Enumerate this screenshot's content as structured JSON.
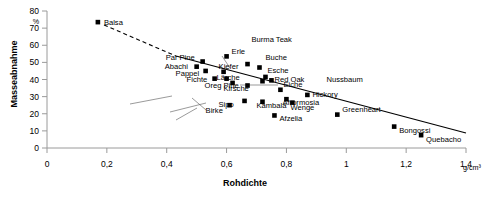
{
  "chart_data": {
    "type": "scatter",
    "title": "",
    "xlabel": "Rohdichte",
    "ylabel": "Masseabnahme",
    "x_unit": "g/cm³",
    "y_unit": "%",
    "xlim": [
      0,
      1.4
    ],
    "ylim": [
      0,
      80
    ],
    "xticks": [
      0,
      0.2,
      0.4,
      0.6,
      0.8,
      1.0,
      1.2,
      1.4
    ],
    "xtick_labels": [
      "0",
      "0,2",
      "0,4",
      "0,6",
      "0,8",
      "1",
      "1,2",
      "1,4"
    ],
    "yticks": [
      0,
      10,
      20,
      30,
      40,
      50,
      60,
      70,
      80
    ],
    "ytick_labels": [
      "0",
      "10",
      "20",
      "30",
      "40",
      "50",
      "60",
      "70",
      "80"
    ],
    "grid": false,
    "legend": "none",
    "marker": "filled-square",
    "trendline": {
      "present": true,
      "style": "solid-with-dashed-extension",
      "note": "Dashed from Balsa point down to approx x=0.42, then solid to x=1.33"
    },
    "points": [
      {
        "name": "Balsa",
        "x": 0.17,
        "y": 73.5,
        "label_dx": 6,
        "label_dy": 3
      },
      {
        "name": "Par Pine",
        "x": 0.52,
        "y": 50.5,
        "label_dx": -37,
        "label_dy": -2
      },
      {
        "name": "Erle",
        "x": 0.6,
        "y": 53.5,
        "label_dx": 5,
        "label_dy": -2
      },
      {
        "name": "Abachi",
        "x": 0.5,
        "y": 47.5,
        "label_dx": -32,
        "label_dy": 2
      },
      {
        "name": "Pappel",
        "x": 0.53,
        "y": 45.0,
        "label_dx": -30,
        "label_dy": 5
      },
      {
        "name": "Kiefer",
        "x": 0.59,
        "y": 44.5,
        "label_dx": -5,
        "label_dy": -3
      },
      {
        "name": "Burma Teak",
        "x": 0.67,
        "y": 49.0,
        "label_dx": 4,
        "label_dy": -22
      },
      {
        "name": "Buche",
        "x": 0.71,
        "y": 47.0,
        "label_dx": 6,
        "label_dy": -8
      },
      {
        "name": "Fichte",
        "x": 0.56,
        "y": 40.5,
        "label_dx": -28,
        "label_dy": 3
      },
      {
        "name": "Lärche",
        "x": 0.6,
        "y": 40.5,
        "label_dx": -10,
        "label_dy": 1
      },
      {
        "name": "Oreg Pine",
        "x": 0.62,
        "y": 38.0,
        "label_dx": -28,
        "label_dy": 5
      },
      {
        "name": "Esche",
        "x": 0.73,
        "y": 41.5,
        "label_dx": 2,
        "label_dy": -4
      },
      {
        "name": "Red Oak",
        "x": 0.75,
        "y": 39.5,
        "label_dx": 3,
        "label_dy": 2
      },
      {
        "name": "Nussbaum",
        "x": 0.72,
        "y": 39.0,
        "label_dx": 64,
        "label_dy": 1
      },
      {
        "name": "Kirsche",
        "x": 0.67,
        "y": 36.5,
        "label_dx": -24,
        "label_dy": 6
      },
      {
        "name": "Eiche",
        "x": 0.78,
        "y": 34.0,
        "label_dx": 3,
        "label_dy": -3
      },
      {
        "name": "Hickory",
        "x": 0.87,
        "y": 31.0,
        "label_dx": 5,
        "label_dy": 2
      },
      {
        "name": "Afrormosia",
        "x": 0.8,
        "y": 28.5,
        "label_dx": -4,
        "label_dy": 6
      },
      {
        "name": "Kambala",
        "x": 0.72,
        "y": 27.0,
        "label_dx": -6,
        "label_dy": 6
      },
      {
        "name": "Wenge",
        "x": 0.82,
        "y": 26.5,
        "label_dx": -2,
        "label_dy": 7
      },
      {
        "name": "Sipo",
        "x": 0.66,
        "y": 27.5,
        "label_dx": -26,
        "label_dy": 6
      },
      {
        "name": "Birke",
        "x": 0.61,
        "y": 25.0,
        "label_dx": -24,
        "label_dy": 8
      },
      {
        "name": "Afzelia",
        "x": 0.76,
        "y": 19.0,
        "label_dx": 5,
        "label_dy": 6
      },
      {
        "name": "Greenheart",
        "x": 0.97,
        "y": 19.5,
        "label_dx": 5,
        "label_dy": -3
      },
      {
        "name": "Bongossi",
        "x": 1.16,
        "y": 12.5,
        "label_dx": 5,
        "label_dy": 6
      },
      {
        "name": "Quebacho",
        "x": 1.25,
        "y": 7.5,
        "label_dx": 5,
        "label_dy": 7
      }
    ],
    "leader_lines": [
      {
        "from_label": "Nussbaum",
        "note": "long horizontal leader to cluster"
      },
      {
        "from_label": "Kirsche",
        "note": "leader from offset label to point"
      },
      {
        "from_label": "Burma Teak",
        "note": "leader from label down to point"
      },
      {
        "from_label": "Birke",
        "note": "leader from label up-left"
      },
      {
        "from_label": "Lärche",
        "note": "leader from label to point"
      }
    ]
  },
  "axis": {
    "x_title": "Rohdichte",
    "y_title": "Masseabnahme",
    "x_unit": "g/cm³",
    "y_unit": "%"
  },
  "colors": {
    "marker": "#000000",
    "axis": "#9a9a9a",
    "trend": "#000000",
    "background": "#ffffff"
  }
}
